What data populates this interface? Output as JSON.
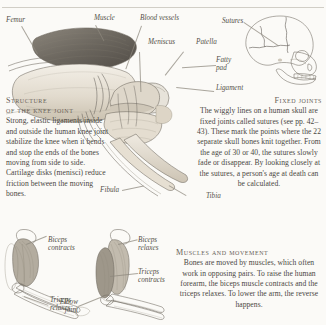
{
  "page": {
    "background_color": "#fbfaf7",
    "ink_color": "#4a4742",
    "has_top_rule": true
  },
  "knee_diagram": {
    "labels": {
      "femur": "Femur",
      "muscle": "Muscle",
      "blood_vessels": "Blood vessels",
      "meniscus": "Meniscus",
      "patella": "Patella",
      "fatty_pad": "Fatty\npad",
      "ligament": "Ligament",
      "fibula": "Fibula",
      "tibia": "Tibia"
    }
  },
  "skull_diagram": {
    "labels": {
      "sutures": "Sutures"
    }
  },
  "structure_block": {
    "heading_line1": "Structure",
    "heading_line2": "of the knee joint",
    "body": "Strong, elastic ligaments inside and outside the human knee joint stabilize the knee when it bends and stop the ends of the bones moving from side to side. Cartilage disks (menisci) reduce friction between the moving bones."
  },
  "fixed_joints_block": {
    "heading": "Fixed joints",
    "body": "The wiggly lines on a human skull are fixed joints called sutures (see pp. 42–43). These mark the points where the 22 separate skull bones knit together. From the age of 30 or 40, the sutures slowly fade or disappear. By looking closely at the sutures, a person's age at death can be calculated."
  },
  "muscles_block": {
    "heading": "Muscles and movement",
    "body": "Bones are moved by muscles, which often work in opposing pairs. To raise the human forearm, the biceps muscle contracts and the triceps relaxes. To lower the arm, the reverse happens."
  },
  "arm_left": {
    "labels": {
      "biceps": "Biceps\ncontracts",
      "triceps": "Triceps\nrelaxes"
    }
  },
  "arm_right": {
    "labels": {
      "biceps": "Biceps\nrelaxes",
      "triceps": "Triceps\ncontracts",
      "elbow": "Elbow\njoint"
    }
  }
}
